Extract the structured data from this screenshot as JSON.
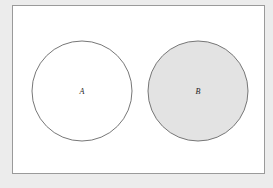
{
  "diagram": {
    "type": "venn",
    "background": "#ececec",
    "frame": {
      "fill": "#ffffff",
      "stroke": "#9a9a9a"
    },
    "sets": [
      {
        "label": "A",
        "cx": 82,
        "cy": 91,
        "r": 50,
        "fill": "#ffffff",
        "stroke": "#777777",
        "shaded": false
      },
      {
        "label": "B",
        "cx": 198,
        "cy": 91,
        "r": 50,
        "fill": "#e3e3e3",
        "stroke": "#777777",
        "shaded": true
      }
    ],
    "relationship": "disjoint"
  }
}
